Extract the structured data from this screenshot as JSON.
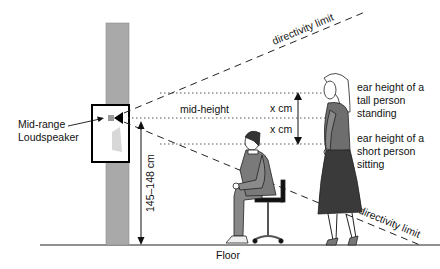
{
  "diagram": {
    "labels": {
      "speaker": [
        "Mid-range",
        "Loudspeaker"
      ],
      "mid_height": "mid-height",
      "x_cm_upper": "x cm",
      "x_cm_lower": "x cm",
      "tall_person": [
        "ear height of a",
        "tall person",
        "standing"
      ],
      "short_person": [
        "ear height of a",
        "short person",
        "sitting"
      ],
      "height_range": "145–148 cm",
      "directivity_upper": "directivity limit",
      "directivity_lower": "directivity limit",
      "floor": "Floor"
    },
    "colors": {
      "pillar": "#a9a9a9",
      "line": "#111111",
      "figure_fill": "#7a7a7a",
      "skirt": "#3a3a3a",
      "background": "#ffffff"
    }
  }
}
